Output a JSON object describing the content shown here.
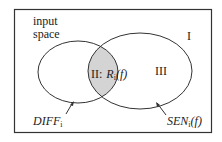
{
  "diagram": {
    "type": "venn",
    "frame_label_line1": "input",
    "frame_label_line2": "space",
    "regions": {
      "outer": "I",
      "intersection_roman": "II:",
      "intersection_func": "R",
      "intersection_sub": "i",
      "intersection_arg": "(f)",
      "right_only": "III"
    },
    "left_set": {
      "name": "DIFF",
      "sub": "i"
    },
    "right_set": {
      "name": "SEN",
      "sub": "i",
      "arg": "(f)"
    },
    "colors": {
      "stroke": "#333333",
      "intersection_fill": "#d4d4d4",
      "background": "#ffffff"
    }
  }
}
